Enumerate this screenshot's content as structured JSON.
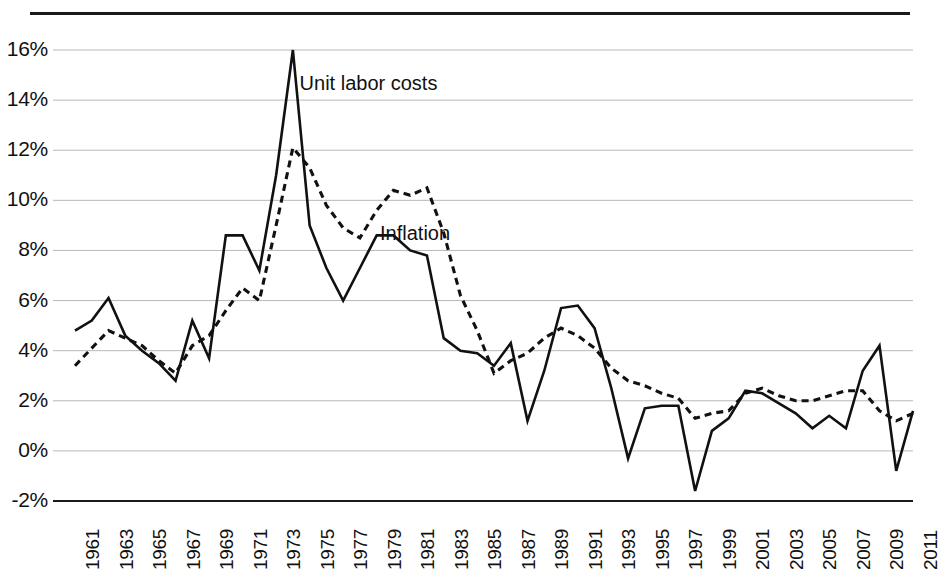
{
  "chart_data": {
    "type": "line",
    "title": "",
    "xlabel": "",
    "ylabel": "",
    "ylim": [
      -2,
      16
    ],
    "ytick_values": [
      16,
      14,
      12,
      10,
      8,
      6,
      4,
      2,
      0,
      -2
    ],
    "ytick_labels": [
      "16%",
      "14%",
      "12%",
      "10%",
      "8%",
      "6%",
      "4%",
      "2%",
      "0%",
      "-2%"
    ],
    "grid": true,
    "legend_position": "inline-annotation",
    "x": [
      1961,
      1962,
      1963,
      1964,
      1965,
      1966,
      1967,
      1968,
      1969,
      1970,
      1971,
      1972,
      1973,
      1974,
      1975,
      1976,
      1977,
      1978,
      1979,
      1980,
      1981,
      1982,
      1983,
      1984,
      1985,
      1986,
      1987,
      1988,
      1989,
      1990,
      1991,
      1992,
      1993,
      1994,
      1995,
      1996,
      1997,
      1998,
      1999,
      2000,
      2001,
      2002,
      2003,
      2004,
      2005,
      2006,
      2007,
      2008,
      2009,
      2010,
      2011
    ],
    "xtick_labels": [
      "1961",
      "1963",
      "1965",
      "1967",
      "1969",
      "1971",
      "1973",
      "1975",
      "1977",
      "1979",
      "1981",
      "1983",
      "1985",
      "1987",
      "1989",
      "1991",
      "1993",
      "1995",
      "1997",
      "1999",
      "2001",
      "2003",
      "2005",
      "2007",
      "2009",
      "2011"
    ],
    "series": [
      {
        "name": "Unit labor costs",
        "style": "solid",
        "color": "#111111",
        "label_x": 1974.4,
        "label_y": 14.6,
        "values": [
          4.8,
          5.2,
          6.1,
          4.6,
          4.0,
          3.5,
          2.8,
          5.2,
          3.7,
          8.6,
          8.6,
          7.2,
          11.0,
          16.0,
          9.0,
          7.3,
          6.0,
          7.3,
          8.6,
          8.6,
          8.0,
          7.8,
          4.5,
          4.0,
          3.9,
          3.4,
          4.3,
          1.2,
          3.2,
          5.7,
          5.8,
          4.9,
          2.5,
          -0.3,
          1.7,
          1.8,
          1.8,
          -1.6,
          0.8,
          1.3,
          2.4,
          2.3,
          1.9,
          1.5,
          0.9,
          1.4,
          0.9,
          3.2,
          4.2,
          -0.8,
          1.6
        ]
      },
      {
        "name": "Inflation",
        "style": "dashed",
        "color": "#111111",
        "label_x": 1979.2,
        "label_y": 8.6,
        "values": [
          3.4,
          4.1,
          4.8,
          4.5,
          4.2,
          3.6,
          3.1,
          4.2,
          4.6,
          5.6,
          6.5,
          6.0,
          9.0,
          12.1,
          11.3,
          9.8,
          8.9,
          8.5,
          9.6,
          10.4,
          10.2,
          10.5,
          8.7,
          6.2,
          4.8,
          3.1,
          3.6,
          3.9,
          4.5,
          4.9,
          4.6,
          4.1,
          3.3,
          2.8,
          2.6,
          2.3,
          2.1,
          1.3,
          1.5,
          1.6,
          2.3,
          2.5,
          2.2,
          2.0,
          2.0,
          2.2,
          2.4,
          2.4,
          1.6,
          1.2,
          1.5
        ]
      }
    ]
  },
  "axis": {
    "baseline_color": "#1a1a1a",
    "grid_color": "#b9b9b9"
  }
}
